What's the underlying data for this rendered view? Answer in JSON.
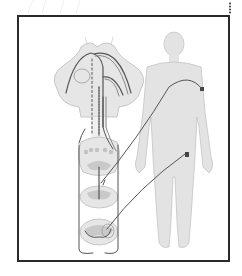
{
  "diagram": {
    "components": [
      {
        "id": "cerebellum",
        "label": ""
      },
      {
        "id": "spinal-cord-section-cervical",
        "label": ""
      },
      {
        "id": "spinal-cord-section-thoracic",
        "label": ""
      },
      {
        "id": "spinal-cord-section-lumbar",
        "label": ""
      },
      {
        "id": "human-body-silhouette",
        "label": ""
      },
      {
        "id": "arm-target",
        "label": ""
      },
      {
        "id": "leg-target",
        "label": ""
      }
    ],
    "colors": {
      "frame": "#2a2a2a",
      "tissue": "#e6e6e6",
      "tissue_outline": "#bdbdbd",
      "gray_matter": "#c9c9c9",
      "body": "#e3e3e3",
      "body_outline": "#c4c4c4",
      "pathway": "#555555",
      "pathway_light": "#8a8a8a",
      "target": "#444444"
    }
  }
}
